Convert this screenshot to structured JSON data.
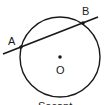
{
  "diagram": {
    "type": "circle-secant",
    "stroke_color": "#1a1a1a",
    "background": "#ffffff",
    "circle": {
      "center": "O",
      "cx": 60,
      "cy": 57,
      "r": 40
    },
    "secant_line": {
      "through": [
        "A",
        "B"
      ],
      "x1": 3,
      "y1": 54,
      "x2": 98,
      "y2": 17
    },
    "points": {
      "A": {
        "label": "A",
        "x": 21,
        "y": 47
      },
      "B": {
        "label": "B",
        "x": 83,
        "y": 23
      },
      "O": {
        "label": "O",
        "x": 60,
        "y": 57
      }
    },
    "caption": "Secant"
  }
}
